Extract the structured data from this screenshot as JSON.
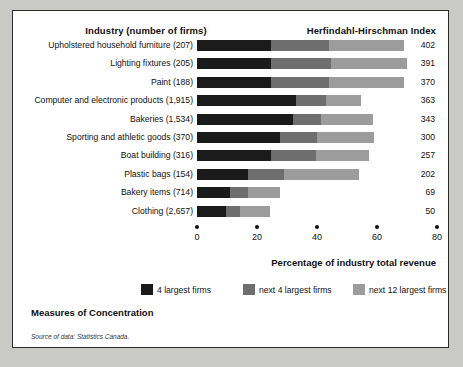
{
  "figure": {
    "header_industry": "Industry (number of firms)",
    "header_hhi": "Herfindahl-Hirschman Index",
    "caption": "Measures of Concentration",
    "source": "Source of data: Statistics Canada."
  },
  "chart_data": {
    "type": "bar",
    "orientation": "horizontal",
    "stacked": true,
    "title": "Measures of Concentration",
    "xlabel": "Percentage of industry total revenue",
    "ylabel": "Industry (number of firms)",
    "xlim": [
      0,
      80
    ],
    "xticks": [
      0,
      20,
      40,
      60,
      80
    ],
    "grid": false,
    "legend_position": "bottom",
    "categories": [
      "Upholstered household furniture  (207)",
      "Lighting fixtures  (205)",
      "Paint  (188)",
      "Computer and electronic products  (1,915)",
      "Bakeries  (1,534)",
      "Sporting and athletic goods  (370)",
      "Boat building (316)",
      "Plastic bags  (154)",
      "Bakery items (714)",
      "Clothing  (2,657)"
    ],
    "series": [
      {
        "name": "4 largest firms",
        "color": "#1b1b1b",
        "values": [
          24.7,
          24.7,
          24.7,
          33.0,
          32.0,
          27.7,
          24.7,
          17.0,
          11.0,
          9.7
        ]
      },
      {
        "name": "next 4 largest firms",
        "color": "#6e6e6e",
        "values": [
          19.3,
          20.0,
          19.3,
          10.0,
          9.3,
          12.3,
          15.0,
          12.0,
          6.0,
          4.7
        ]
      },
      {
        "name": "next 12 largest firms",
        "color": "#9c9c9c",
        "values": [
          25.0,
          25.3,
          25.0,
          11.7,
          17.3,
          19.0,
          17.7,
          25.0,
          10.7,
          10.0
        ]
      }
    ],
    "annotations": {
      "label": "Herfindahl-Hirschman Index",
      "values": [
        402,
        391,
        370,
        363,
        343,
        300,
        257,
        202,
        69,
        50
      ]
    }
  }
}
